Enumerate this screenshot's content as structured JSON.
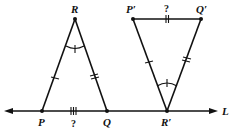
{
  "diagram": {
    "type": "geometry",
    "line": {
      "label": "L",
      "y": 111,
      "x_start": 6,
      "x_end": 215
    },
    "triangle_1": {
      "vertices": {
        "P": {
          "label": "P",
          "x": 42,
          "y": 111
        },
        "Q": {
          "label": "Q",
          "x": 107,
          "y": 111
        },
        "R": {
          "label": "R",
          "x": 75,
          "y": 19
        }
      },
      "base_marker": {
        "ticks": 3,
        "label": "?"
      },
      "side_PR_ticks": 1,
      "side_QR_ticks": 2,
      "angle_R_marks": 1
    },
    "triangle_2": {
      "vertices": {
        "P_prime": {
          "label": "P′",
          "x": 133,
          "y": 19
        },
        "Q_prime": {
          "label": "Q′",
          "x": 201,
          "y": 19
        },
        "R_prime": {
          "label": "R′",
          "x": 167,
          "y": 111
        }
      },
      "base_marker": {
        "ticks": 2,
        "label": "?"
      },
      "side_PR_ticks": 1,
      "side_QR_ticks": 2,
      "angle_R_marks": 1
    }
  }
}
